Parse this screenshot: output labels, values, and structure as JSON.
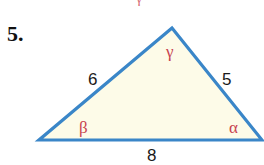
{
  "problem": {
    "number": "5."
  },
  "triangle": {
    "vertices": {
      "top": [
        172,
        28
      ],
      "left": [
        39,
        140
      ],
      "right": [
        262,
        140
      ]
    },
    "sides": {
      "left": "6",
      "right": "5",
      "bottom": "8"
    },
    "angles": {
      "top": "γ",
      "left": "β",
      "right": "α"
    },
    "colors": {
      "stroke": "#3a86c8",
      "fill": "#fdfbe8",
      "angle_label": "#c8434f"
    }
  },
  "fragment": {
    "text": "γ"
  }
}
